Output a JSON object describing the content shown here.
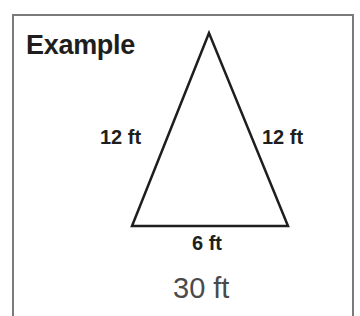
{
  "title": "Example",
  "triangle": {
    "apex": [
      209,
      33
    ],
    "bottom_left": [
      132,
      226
    ],
    "bottom_right": [
      288,
      226
    ],
    "left_side_label": "12 ft",
    "right_side_label": "12 ft",
    "base_label": "6 ft",
    "stroke_color": "#1e1e1e"
  },
  "answer": "30 ft",
  "colors": {
    "frame": "#7a7a7a",
    "text": "#1e1e1e",
    "answer": "#4a4a4a"
  }
}
